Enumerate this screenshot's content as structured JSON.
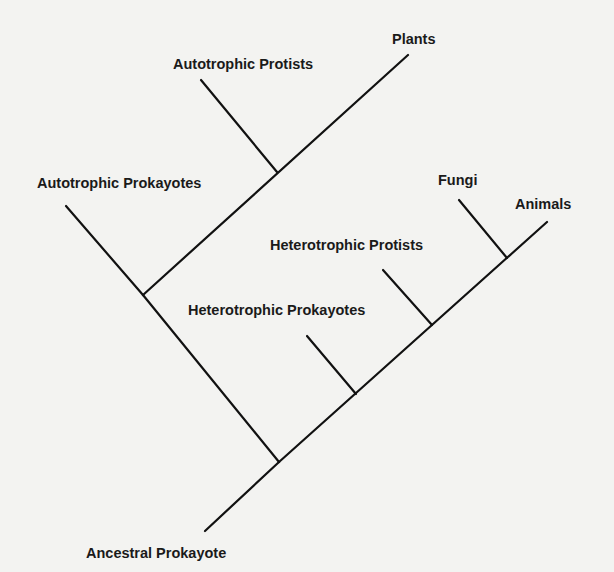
{
  "colors": {
    "background": "#f3f3f1",
    "line": "#111111",
    "text": "#1a1a1a"
  },
  "taxa": {
    "plants": "Plants",
    "autotrophic_protists": "Autotrophic Protists",
    "autotrophic_prokaryotes": "Autotrophic Prokayotes",
    "fungi": "Fungi",
    "animals": "Animals",
    "heterotrophic_protists": "Heterotrophic Protists",
    "heterotrophic_prokaryotes": "Heterotrophic Prokayotes",
    "ancestral_prokaryote": "Ancestral Prokayote"
  },
  "tree": {
    "root": "Ancestral Prokayote",
    "children": [
      {
        "node": "autotroph-clade",
        "children": [
          "Autotrophic Prokayotes",
          {
            "node": "protist-plant-clade",
            "children": [
              "Autotrophic Protists",
              "Plants"
            ]
          }
        ]
      },
      {
        "node": "heterotroph-clade",
        "children": [
          "Heterotrophic Prokayotes",
          {
            "node": "euk-heterotroph-clade",
            "children": [
              "Heterotrophic Protists",
              {
                "node": "fungi-animal-clade",
                "children": [
                  "Fungi",
                  "Animals"
                ]
              }
            ]
          }
        ]
      }
    ]
  }
}
